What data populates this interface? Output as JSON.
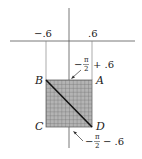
{
  "diagram": {
    "type": "region-mapping",
    "axes": {
      "horizontal_ticks": [
        {
          "label": "−.6",
          "value": -0.6
        },
        {
          "label": ".6",
          "value": 0.6
        }
      ]
    },
    "square": {
      "corners": {
        "A": "A",
        "B": "B",
        "C": "C",
        "D": "D"
      },
      "fill_pattern": "grid",
      "diagonal": "B-D"
    },
    "annotations": {
      "upper": {
        "prefix": "−",
        "numerator": "π",
        "denominator": "2",
        "suffix": "+ .6"
      },
      "lower": {
        "prefix": "−",
        "numerator": "π",
        "denominator": "2",
        "suffix": "− .6"
      }
    }
  },
  "colors": {
    "axis": "#444444",
    "grid_fill": "#a8a8a8",
    "grid_line": "#6a6a6a",
    "diagonal": "#111111"
  }
}
